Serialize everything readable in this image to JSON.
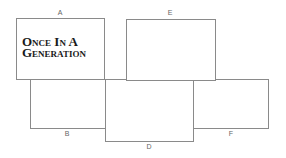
{
  "diagram": {
    "panels": [
      {
        "id": "A",
        "label": "A",
        "text_lines": [
          "Once In A",
          "Generation"
        ]
      },
      {
        "id": "E",
        "label": "E"
      },
      {
        "id": "B",
        "label": "B"
      },
      {
        "id": "D",
        "label": "D"
      },
      {
        "id": "F",
        "label": "F"
      }
    ]
  }
}
